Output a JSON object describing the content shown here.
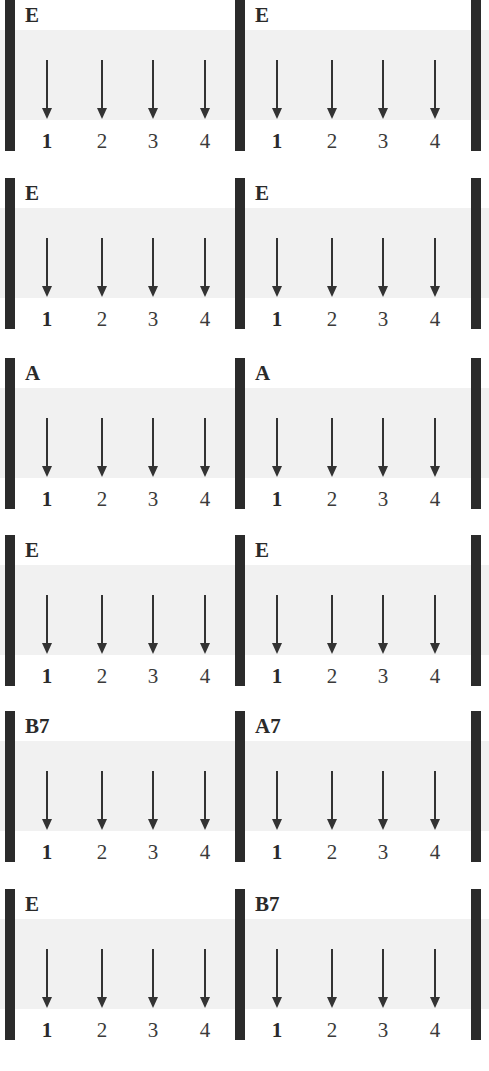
{
  "title": "",
  "rows": [
    {
      "top": 0,
      "measures": [
        {
          "chord": "E"
        },
        {
          "chord": "E"
        }
      ]
    },
    {
      "top": 178,
      "measures": [
        {
          "chord": "E"
        },
        {
          "chord": "E"
        }
      ]
    },
    {
      "top": 358,
      "measures": [
        {
          "chord": "A"
        },
        {
          "chord": "A"
        }
      ]
    },
    {
      "top": 535,
      "measures": [
        {
          "chord": "E"
        },
        {
          "chord": "E"
        }
      ]
    },
    {
      "top": 711,
      "measures": [
        {
          "chord": "B7"
        },
        {
          "chord": "A7"
        }
      ]
    },
    {
      "top": 889,
      "measures": [
        {
          "chord": "E"
        },
        {
          "chord": "B7"
        }
      ]
    }
  ],
  "beats": [
    "1",
    "2",
    "3",
    "4"
  ],
  "beat_icon": "down-strum-arrow-icon",
  "colors": {
    "barline": "#2b2b2b",
    "band": "#f1f1f1",
    "arrow": "#333333"
  }
}
